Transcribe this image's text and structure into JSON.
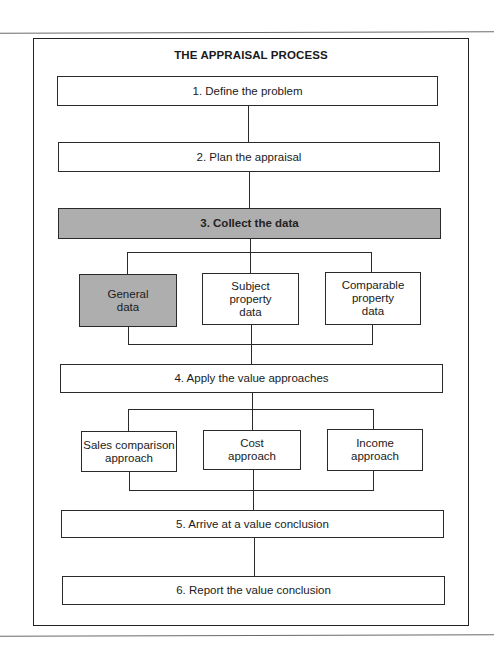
{
  "diagram": {
    "title": "THE APPRAISAL PROCESS",
    "steps": [
      {
        "number": "1.",
        "label": "1. Define the problem",
        "shaded": false
      },
      {
        "number": "2.",
        "label": "2.  Plan the appraisal",
        "shaded": false
      },
      {
        "number": "3.",
        "label": "3.  Collect the data",
        "shaded": true
      },
      {
        "number": "4.",
        "label": "4.  Apply the value approaches",
        "shaded": false
      },
      {
        "number": "5.",
        "label": "5.  Arrive at a value conclusion",
        "shaded": false
      },
      {
        "number": "6.",
        "label": "6.  Report the value conclusion",
        "shaded": false
      }
    ],
    "data_categories": [
      {
        "line1": "General",
        "line2": "data",
        "line3": "",
        "shaded": true
      },
      {
        "line1": "Subject",
        "line2": "property",
        "line3": "data",
        "shaded": false
      },
      {
        "line1": "Comparable",
        "line2": "property",
        "line3": "data",
        "shaded": false
      }
    ],
    "approaches": [
      {
        "line1": "Sales comparison",
        "line2": "approach"
      },
      {
        "line1": "Cost",
        "line2": "approach"
      },
      {
        "line1": "Income",
        "line2": "approach"
      }
    ],
    "colors": {
      "line": "#2a2a2a",
      "shaded_fill": "#d2d2d2",
      "background": "#ffffff"
    }
  }
}
